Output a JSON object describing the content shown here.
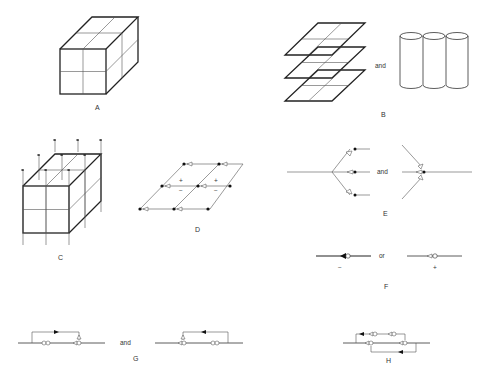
{
  "figure": {
    "panels": [
      {
        "id": "A",
        "label": "A",
        "description": "2x2x2 cube of cells"
      },
      {
        "id": "B",
        "label": "B",
        "connector": "and",
        "description": "stacked 2x2 planes and three vertical cylinders"
      },
      {
        "id": "C",
        "label": "C",
        "description": "2x2x2 cube with vertical arrows passing through"
      },
      {
        "id": "D",
        "label": "D",
        "signs": [
          "+",
          "−",
          "+",
          "−"
        ],
        "description": "2x2 grid with dots and open arrowheads"
      },
      {
        "id": "E",
        "label": "E",
        "connector": "and",
        "description": "branching lines with open arrowheads and dots"
      },
      {
        "id": "F",
        "label": "F",
        "connector": "or",
        "signs": [
          "−",
          "+"
        ],
        "description": "line symbols with filled/open arrowheads"
      },
      {
        "id": "G",
        "label": "G",
        "connector": "and",
        "description": "loop circuits with arrows"
      },
      {
        "id": "H",
        "label": "H",
        "description": "double loop circuit"
      }
    ]
  }
}
